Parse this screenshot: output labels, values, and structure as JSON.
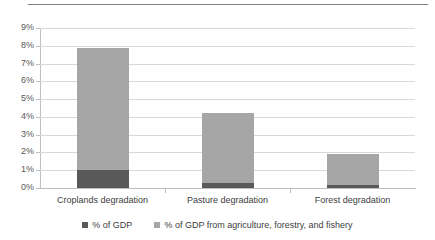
{
  "chart_data": {
    "type": "bar",
    "title": "",
    "subtitle": "",
    "xlabel": "",
    "ylabel": "",
    "stacked": true,
    "grid": true,
    "legend_position": "bottom",
    "ylim": [
      0,
      9
    ],
    "ytick_labels": [
      "9%",
      "8%",
      "7%",
      "6%",
      "5%",
      "4%",
      "3%",
      "2%",
      "1%",
      "0%"
    ],
    "ytick_values": [
      9,
      8,
      7,
      6,
      5,
      4,
      3,
      2,
      1,
      0
    ],
    "categories": [
      "Croplands degradation",
      "Pasture degradation",
      "Forest degradation"
    ],
    "series": [
      {
        "name": "% of GDP",
        "color": "#595959",
        "values": [
          1.0,
          0.3,
          0.15
        ]
      },
      {
        "name": "% of GDP from agriculture, forestry, and fishery",
        "color": "#a6a6a6",
        "values": [
          6.9,
          3.9,
          1.75
        ]
      }
    ],
    "totals": [
      7.9,
      4.2,
      1.9
    ]
  },
  "colors": {
    "series_dark": "#595959",
    "series_light": "#a6a6a6",
    "gridline": "#d9d9d9",
    "axis": "#bfbfbf",
    "top_rule": "#808080",
    "text": "#404040"
  }
}
